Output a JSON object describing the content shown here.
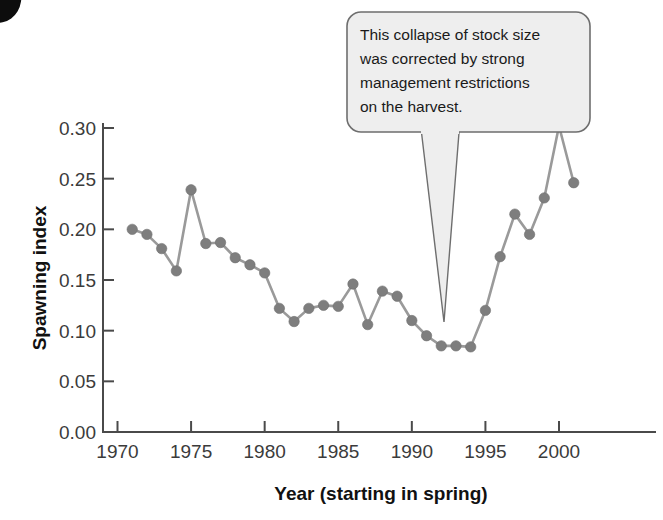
{
  "figure": {
    "annotation": {
      "lines": [
        "This collapse of stock size",
        "was corrected by strong",
        "management restrictions",
        "on the harvest."
      ],
      "points_at_year": 1991
    }
  },
  "chart_data": {
    "type": "line",
    "title": "",
    "subtitle": "",
    "xlabel": "Year (starting in spring)",
    "ylabel": "Spawning index",
    "xlim": [
      1969,
      2003
    ],
    "ylim": [
      0.0,
      0.315
    ],
    "xticks": [
      1970,
      1975,
      1980,
      1985,
      1990,
      1995,
      2000
    ],
    "xtick_labels": [
      "1970",
      "1975",
      "1980",
      "1985",
      "1990",
      "1995",
      "2000"
    ],
    "yticks": [
      0.0,
      0.05,
      0.1,
      0.15,
      0.2,
      0.25,
      0.3
    ],
    "ytick_labels": [
      "0.00",
      "0.05",
      "0.10",
      "0.15",
      "0.20",
      "0.25",
      "0.30"
    ],
    "grid": false,
    "legend": false,
    "marker": "circle",
    "line_color": "#9a9a9a",
    "marker_color": "#7e7e7e",
    "x": [
      1971,
      1972,
      1973,
      1974,
      1975,
      1976,
      1977,
      1978,
      1979,
      1980,
      1981,
      1982,
      1983,
      1984,
      1985,
      1986,
      1987,
      1988,
      1989,
      1990,
      1991,
      1992,
      1993,
      1994,
      1995,
      1996,
      1997,
      1998,
      1999,
      2000,
      2001
    ],
    "values": [
      0.2,
      0.195,
      0.181,
      0.159,
      0.239,
      0.186,
      0.187,
      0.172,
      0.165,
      0.157,
      0.122,
      0.109,
      0.122,
      0.125,
      0.124,
      0.146,
      0.106,
      0.139,
      0.134,
      0.11,
      0.095,
      0.085,
      0.085,
      0.084,
      0.12,
      0.173,
      0.215,
      0.195,
      0.231,
      0.302,
      0.246
    ],
    "annotations": [
      {
        "text": "This collapse of stock size was corrected by strong management restrictions on the harvest.",
        "points_at": {
          "x": 1991,
          "y": 0.095
        }
      }
    ]
  }
}
